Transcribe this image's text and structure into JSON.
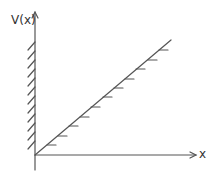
{
  "diagram": {
    "y_axis_label": "V(x)",
    "x_axis_label": "x",
    "colors": {
      "stroke": "#555555",
      "background": "#ffffff"
    },
    "elements": [
      {
        "type": "axis",
        "name": "y-axis",
        "label": "V(x)",
        "arrow": "up"
      },
      {
        "type": "axis",
        "name": "x-axis",
        "label": "x",
        "arrow": "right"
      },
      {
        "type": "hatched-wall",
        "name": "infinite-wall",
        "position": "x=0",
        "hatch_side": "left",
        "hatch_count": 12
      },
      {
        "type": "line",
        "name": "linear-potential",
        "from": "origin",
        "slope": "positive",
        "hatch_side": "right",
        "hatch_count": 11
      }
    ]
  }
}
